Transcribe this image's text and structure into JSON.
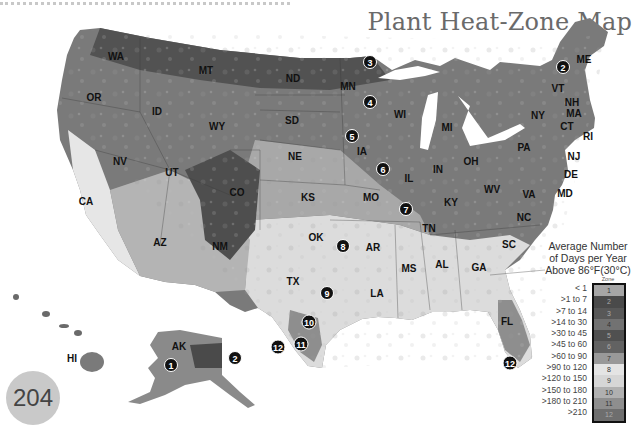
{
  "page": {
    "title": "Plant Heat-Zone Map",
    "page_number": "204"
  },
  "legend": {
    "title_line1": "Average Number",
    "title_line2": "of Days per Year",
    "title_line3": "Above 86°F(30°C)",
    "zone_header": "Zone",
    "zones": [
      {
        "zone": "1",
        "range": "< 1",
        "color": "#a6a6a6"
      },
      {
        "zone": "2",
        "range": ">1 to 7",
        "color": "#4a4a4a"
      },
      {
        "zone": "3",
        "range": ">7 to 14",
        "color": "#585858"
      },
      {
        "zone": "4",
        "range": ">14 to 30",
        "color": "#727272"
      },
      {
        "zone": "5",
        "range": ">30 to 45",
        "color": "#505050"
      },
      {
        "zone": "6",
        "range": ">45 to 60",
        "color": "#626262"
      },
      {
        "zone": "7",
        "range": ">60 to 90",
        "color": "#999999"
      },
      {
        "zone": "8",
        "range": ">90 to 120",
        "color": "#e4e4e4"
      },
      {
        "zone": "9",
        "range": ">120 to 150",
        "color": "#d6d6d6"
      },
      {
        "zone": "10",
        "range": ">150 to 180",
        "color": "#b0b0b0"
      },
      {
        "zone": "11",
        "range": ">180 to 210",
        "color": "#8e8e8e"
      },
      {
        "zone": "12",
        "range": ">210",
        "color": "#6e6e6e"
      }
    ]
  },
  "map": {
    "states": [
      {
        "abbr": "WA",
        "x": 116,
        "y": 60
      },
      {
        "abbr": "OR",
        "x": 94,
        "y": 101
      },
      {
        "abbr": "CA",
        "x": 86,
        "y": 205
      },
      {
        "abbr": "ID",
        "x": 157,
        "y": 115
      },
      {
        "abbr": "NV",
        "x": 120,
        "y": 165
      },
      {
        "abbr": "MT",
        "x": 206,
        "y": 74
      },
      {
        "abbr": "WY",
        "x": 217,
        "y": 130
      },
      {
        "abbr": "UT",
        "x": 172,
        "y": 176
      },
      {
        "abbr": "CO",
        "x": 237,
        "y": 196
      },
      {
        "abbr": "AZ",
        "x": 160,
        "y": 246
      },
      {
        "abbr": "NM",
        "x": 220,
        "y": 250
      },
      {
        "abbr": "ND",
        "x": 293,
        "y": 82
      },
      {
        "abbr": "SD",
        "x": 292,
        "y": 124
      },
      {
        "abbr": "NE",
        "x": 295,
        "y": 160
      },
      {
        "abbr": "KS",
        "x": 308,
        "y": 201
      },
      {
        "abbr": "OK",
        "x": 316,
        "y": 241
      },
      {
        "abbr": "TX",
        "x": 293,
        "y": 285
      },
      {
        "abbr": "MN",
        "x": 348,
        "y": 90
      },
      {
        "abbr": "IA",
        "x": 362,
        "y": 155
      },
      {
        "abbr": "MO",
        "x": 371,
        "y": 201
      },
      {
        "abbr": "AR",
        "x": 373,
        "y": 251
      },
      {
        "abbr": "LA",
        "x": 377,
        "y": 297
      },
      {
        "abbr": "WI",
        "x": 400,
        "y": 118
      },
      {
        "abbr": "IL",
        "x": 409,
        "y": 182
      },
      {
        "abbr": "MI",
        "x": 447,
        "y": 131
      },
      {
        "abbr": "IN",
        "x": 438,
        "y": 173
      },
      {
        "abbr": "OH",
        "x": 471,
        "y": 165
      },
      {
        "abbr": "KY",
        "x": 451,
        "y": 206
      },
      {
        "abbr": "TN",
        "x": 429,
        "y": 232
      },
      {
        "abbr": "MS",
        "x": 409,
        "y": 272
      },
      {
        "abbr": "AL",
        "x": 442,
        "y": 268
      },
      {
        "abbr": "GA",
        "x": 479,
        "y": 271
      },
      {
        "abbr": "FL",
        "x": 507,
        "y": 325
      },
      {
        "abbr": "SC",
        "x": 509,
        "y": 248
      },
      {
        "abbr": "NC",
        "x": 524,
        "y": 221
      },
      {
        "abbr": "VA",
        "x": 529,
        "y": 198
      },
      {
        "abbr": "WV",
        "x": 492,
        "y": 193
      },
      {
        "abbr": "PA",
        "x": 524,
        "y": 151
      },
      {
        "abbr": "NY",
        "x": 538,
        "y": 119
      },
      {
        "abbr": "VT",
        "x": 558,
        "y": 92
      },
      {
        "abbr": "NH",
        "x": 572,
        "y": 106
      },
      {
        "abbr": "MA",
        "x": 574,
        "y": 117
      },
      {
        "abbr": "CT",
        "x": 567,
        "y": 130
      },
      {
        "abbr": "ME",
        "x": 584,
        "y": 63
      },
      {
        "abbr": "AK",
        "x": 179,
        "y": 350
      },
      {
        "abbr": "HI",
        "x": 72,
        "y": 362
      }
    ],
    "outside_labels": [
      {
        "abbr": "RI",
        "x": 588,
        "y": 140
      },
      {
        "abbr": "NJ",
        "x": 574,
        "y": 160
      },
      {
        "abbr": "DE",
        "x": 571,
        "y": 178
      },
      {
        "abbr": "MD",
        "x": 565,
        "y": 197
      }
    ],
    "markers": [
      {
        "n": "1",
        "x": 171,
        "y": 365
      },
      {
        "n": "2",
        "x": 235,
        "y": 358
      },
      {
        "n": "2",
        "x": 563,
        "y": 67
      },
      {
        "n": "3",
        "x": 370,
        "y": 62
      },
      {
        "n": "4",
        "x": 370,
        "y": 102
      },
      {
        "n": "5",
        "x": 352,
        "y": 136
      },
      {
        "n": "6",
        "x": 383,
        "y": 169
      },
      {
        "n": "7",
        "x": 406,
        "y": 209
      },
      {
        "n": "8",
        "x": 343,
        "y": 246
      },
      {
        "n": "9",
        "x": 327,
        "y": 293
      },
      {
        "n": "10",
        "x": 309,
        "y": 322
      },
      {
        "n": "11",
        "x": 301,
        "y": 344
      },
      {
        "n": "12",
        "x": 278,
        "y": 347
      },
      {
        "n": "12",
        "x": 510,
        "y": 363
      }
    ]
  }
}
